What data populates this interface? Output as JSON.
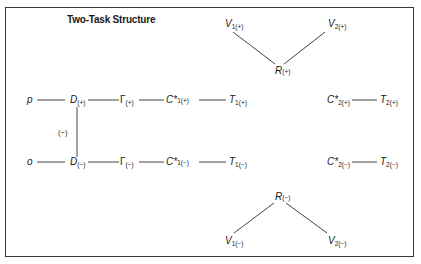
{
  "title": "Two-Task Structure",
  "vertical_label": "(−)",
  "nodes": {
    "p": {
      "main": "p",
      "sub": ""
    },
    "o": {
      "main": "o",
      "sub": ""
    },
    "D_plus": {
      "main": "D",
      "sub": "(+)"
    },
    "D_minus": {
      "main": "D",
      "sub": "(−)"
    },
    "G_plus": {
      "main": "Γ",
      "sub": "(+)"
    },
    "G_minus": {
      "main": "Γ",
      "sub": "(−)"
    },
    "C1_plus": {
      "main": "C*",
      "sub": "1(+)"
    },
    "C1_minus": {
      "main": "C*",
      "sub": "1(−)"
    },
    "T1_plus": {
      "main": "T",
      "sub": "1(+)"
    },
    "T1_minus": {
      "main": "T",
      "sub": "1(−)"
    },
    "C2_plus": {
      "main": "C*",
      "sub": "2(+)"
    },
    "C2_minus": {
      "main": "C*",
      "sub": "2(−)"
    },
    "T2_plus": {
      "main": "T",
      "sub": "2(+)"
    },
    "T2_minus": {
      "main": "T",
      "sub": "2(−)"
    },
    "R_plus": {
      "main": "R",
      "sub": "(+)"
    },
    "R_minus": {
      "main": "R",
      "sub": "(−)"
    },
    "V1_plus": {
      "main": "V",
      "sub": "1(+)"
    },
    "V2_plus": {
      "main": "V",
      "sub": "2(+)"
    },
    "V1_minus": {
      "main": "V",
      "sub": "1(−)"
    },
    "V2_minus": {
      "main": "V",
      "sub": "2(−)"
    }
  },
  "edges": [
    [
      "p",
      "D_plus"
    ],
    [
      "D_plus",
      "G_plus"
    ],
    [
      "G_plus",
      "C1_plus"
    ],
    [
      "C1_plus",
      "T1_plus"
    ],
    [
      "o",
      "D_minus"
    ],
    [
      "D_minus",
      "G_minus"
    ],
    [
      "G_minus",
      "C1_minus"
    ],
    [
      "C1_minus",
      "T1_minus"
    ],
    [
      "D_plus",
      "D_minus"
    ],
    [
      "C2_plus",
      "T2_plus"
    ],
    [
      "C2_minus",
      "T2_minus"
    ],
    [
      "V1_plus",
      "R_plus"
    ],
    [
      "V2_plus",
      "R_plus"
    ],
    [
      "R_minus",
      "V1_minus"
    ],
    [
      "R_minus",
      "V2_minus"
    ]
  ]
}
